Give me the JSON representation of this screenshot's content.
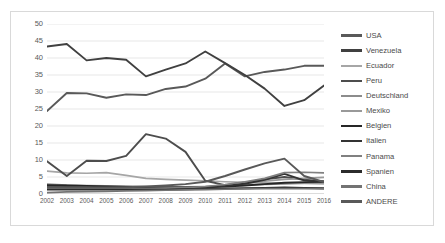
{
  "chart_data": {
    "type": "line",
    "title": "",
    "xlabel": "",
    "ylabel": "",
    "x": [
      2002,
      2003,
      2004,
      2005,
      2006,
      2007,
      2008,
      2009,
      2010,
      2011,
      2012,
      2013,
      2014,
      2015,
      2016
    ],
    "categories": [
      "2002",
      "2003",
      "2004",
      "2005",
      "2006",
      "2007",
      "2008",
      "2009",
      "2010",
      "2011",
      "2012",
      "2013",
      "2014",
      "2015",
      "2016"
    ],
    "ylim": [
      0,
      50
    ],
    "ytick_values": [
      0,
      5,
      10,
      15,
      20,
      25,
      30,
      35,
      40,
      45,
      50
    ],
    "ytick_labels": [
      "0",
      "5",
      "10",
      "15",
      "20",
      "25",
      "30",
      "35",
      "40",
      "45",
      "50"
    ],
    "grid": true,
    "legend_position": "right",
    "series": [
      {
        "name": "USA",
        "color": "#595959",
        "width": 1.9,
        "values": [
          24.4,
          29.7,
          29.6,
          28.3,
          29.3,
          29.1,
          30.9,
          31.6,
          33.9,
          38.4,
          34.6,
          35.9,
          36.6,
          37.7,
          37.7
        ]
      },
      {
        "name": "Venezuela",
        "color": "#404040",
        "width": 1.9,
        "values": [
          43.4,
          44.1,
          39.3,
          40.0,
          39.5,
          34.6,
          36.6,
          38.4,
          41.9,
          38.5,
          35.0,
          31.0,
          25.9,
          27.6,
          31.9
        ]
      },
      {
        "name": "Ecuador",
        "color": "#a6a6a6",
        "width": 1.7,
        "values": [
          6.7,
          6.2,
          6.1,
          6.3,
          5.5,
          4.6,
          4.3,
          4.1,
          3.9,
          3.6,
          3.4,
          3.3,
          3.2,
          3.1,
          3.0
        ]
      },
      {
        "name": "Peru",
        "color": "#4d4d4d",
        "width": 1.9,
        "values": [
          9.6,
          5.3,
          9.8,
          9.7,
          11.2,
          17.6,
          16.3,
          12.4,
          3.9,
          2.6,
          3.4,
          4.3,
          5.0,
          4.2,
          3.6
        ]
      },
      {
        "name": "Deutschland",
        "color": "#8c8c8c",
        "width": 1.7,
        "values": [
          2.9,
          2.6,
          2.5,
          2.4,
          2.3,
          2.2,
          2.1,
          2.1,
          2.2,
          2.4,
          2.6,
          2.8,
          3.0,
          3.2,
          3.4
        ]
      },
      {
        "name": "Mexiko",
        "color": "#999999",
        "width": 1.7,
        "values": [
          2.2,
          2.1,
          2.0,
          2.0,
          1.9,
          1.8,
          1.8,
          1.9,
          2.1,
          2.6,
          3.2,
          3.8,
          4.3,
          4.6,
          4.9
        ]
      },
      {
        "name": "Belgien",
        "color": "#262626",
        "width": 1.9,
        "values": [
          2.6,
          2.5,
          2.4,
          2.2,
          2.1,
          2.0,
          1.9,
          1.9,
          2.0,
          2.2,
          2.5,
          2.9,
          3.3,
          3.5,
          3.6
        ]
      },
      {
        "name": "Italien",
        "color": "#333333",
        "width": 1.9,
        "values": [
          2.0,
          2.0,
          1.9,
          1.8,
          1.8,
          1.7,
          1.7,
          1.8,
          2.0,
          2.4,
          3.0,
          4.2,
          5.9,
          4.0,
          3.7
        ]
      },
      {
        "name": "Panama",
        "color": "#808080",
        "width": 1.7,
        "values": [
          1.6,
          1.6,
          1.6,
          1.6,
          1.6,
          1.6,
          1.7,
          1.9,
          2.2,
          2.8,
          3.6,
          4.6,
          6.3,
          6.4,
          6.2
        ]
      },
      {
        "name": "Spanien",
        "color": "#2b2b2b",
        "width": 1.9,
        "values": [
          1.3,
          1.3,
          1.3,
          1.3,
          1.3,
          1.3,
          1.3,
          1.4,
          1.5,
          1.6,
          1.7,
          1.8,
          1.9,
          1.8,
          1.7
        ]
      },
      {
        "name": "China",
        "color": "#737373",
        "width": 1.7,
        "values": [
          0.4,
          0.6,
          0.7,
          0.8,
          0.9,
          1.0,
          1.1,
          1.2,
          1.3,
          1.4,
          1.5,
          1.6,
          1.6,
          1.6,
          1.5
        ]
      },
      {
        "name": "ANDERE",
        "color": "#595959",
        "width": 1.9,
        "values": [
          2.0,
          1.9,
          1.9,
          1.9,
          2.0,
          2.2,
          2.5,
          2.9,
          3.6,
          5.3,
          7.2,
          9.0,
          10.4,
          5.3,
          3.5
        ]
      }
    ]
  },
  "legend": {
    "items": [
      {
        "label": "USA"
      },
      {
        "label": "Venezuela"
      },
      {
        "label": "Ecuador"
      },
      {
        "label": "Peru"
      },
      {
        "label": "Deutschland"
      },
      {
        "label": "Mexiko"
      },
      {
        "label": "Belgien"
      },
      {
        "label": "Italien"
      },
      {
        "label": "Panama"
      },
      {
        "label": "Spanien"
      },
      {
        "label": "China"
      },
      {
        "label": "ANDERE"
      }
    ]
  }
}
